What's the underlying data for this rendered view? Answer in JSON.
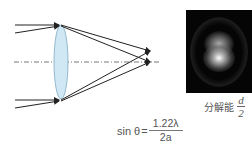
{
  "diagram": {
    "colors": {
      "lens_fill": "#cfe8f4",
      "lens_stroke": "#7fa9c2",
      "ray": "#222222",
      "axis": "#555555",
      "airy_background": "#050505"
    },
    "lens_label": "convex-lens",
    "airy_image_label": "airy-pattern-two-points"
  },
  "caption": {
    "prefix": "分解能",
    "numerator": "d",
    "denominator": "2"
  },
  "formula": {
    "lhs": "sin θ",
    "equals": "=",
    "numerator": "1.22λ",
    "denominator": "2a"
  }
}
